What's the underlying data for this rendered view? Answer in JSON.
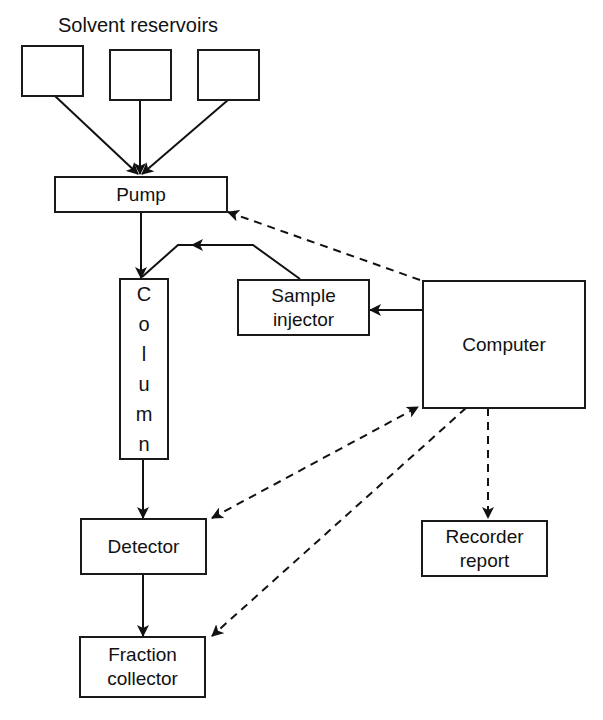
{
  "diagram": {
    "title": "Solvent reservoirs",
    "nodes": {
      "reservoir1": "",
      "reservoir2": "",
      "reservoir3": "",
      "pump": "Pump",
      "column_letters": [
        "C",
        "o",
        "l",
        "u",
        "m",
        "n"
      ],
      "sample_injector_line1": "Sample",
      "sample_injector_line2": "injector",
      "computer": "Computer",
      "detector": "Detector",
      "recorder_line1": "Recorder",
      "recorder_line2": "report",
      "fraction_line1": "Fraction",
      "fraction_line2": "collector"
    },
    "edges": [
      {
        "from": "reservoir1",
        "to": "pump",
        "style": "solid"
      },
      {
        "from": "reservoir2",
        "to": "pump",
        "style": "solid"
      },
      {
        "from": "reservoir3",
        "to": "pump",
        "style": "solid"
      },
      {
        "from": "pump",
        "to": "column",
        "style": "solid"
      },
      {
        "from": "sample_injector",
        "to": "column",
        "style": "solid"
      },
      {
        "from": "computer",
        "to": "sample_injector",
        "style": "solid"
      },
      {
        "from": "computer",
        "to": "pump",
        "style": "dashed"
      },
      {
        "from": "detector",
        "to": "computer",
        "style": "dashed",
        "bidirectional": true
      },
      {
        "from": "computer",
        "to": "fraction_collector",
        "style": "dashed"
      },
      {
        "from": "computer",
        "to": "recorder_report",
        "style": "dashed"
      },
      {
        "from": "column",
        "to": "detector",
        "style": "solid"
      },
      {
        "from": "detector",
        "to": "fraction_collector",
        "style": "solid"
      }
    ]
  }
}
